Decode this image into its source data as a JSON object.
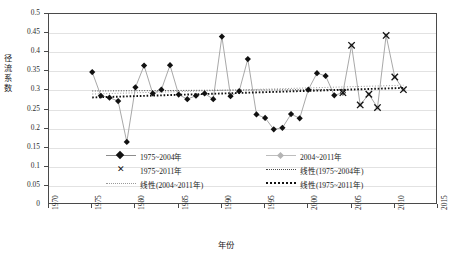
{
  "chart_data": {
    "type": "line",
    "title": "",
    "xlabel": "年份",
    "ylabel": "径流系数",
    "xlim": [
      1970,
      2015
    ],
    "ylim": [
      0,
      0.5
    ],
    "xticks": [
      "1970",
      "1975",
      "1980",
      "1985",
      "1990",
      "1995",
      "2000",
      "2005",
      "2010",
      "2015"
    ],
    "yticks": [
      "0",
      "0.05",
      "0.1",
      "0.15",
      "0.2",
      "0.25",
      "0.3",
      "0.35",
      "0.4",
      "0.45",
      "0.5"
    ],
    "grid": "horizontal",
    "legend_position": "inside-lower-center",
    "series": [
      {
        "name": "1975~2004年",
        "marker": "diamond",
        "color": "#111111",
        "line_color": "#9a9a9a",
        "x": [
          1975,
          1976,
          1977,
          1978,
          1979,
          1980,
          1981,
          1982,
          1983,
          1984,
          1985,
          1986,
          1987,
          1988,
          1989,
          1990,
          1991,
          1992,
          1993,
          1994,
          1995,
          1996,
          1997,
          1998,
          1999,
          2000,
          2001,
          2002,
          2003,
          2004
        ],
        "values": [
          0.348,
          0.286,
          0.281,
          0.272,
          0.165,
          0.308,
          0.365,
          0.292,
          0.302,
          0.366,
          0.289,
          0.277,
          0.286,
          0.292,
          0.277,
          0.441,
          0.285,
          0.298,
          0.382,
          0.237,
          0.228,
          0.198,
          0.202,
          0.238,
          0.227,
          0.302,
          0.345,
          0.338,
          0.287,
          0.294
        ]
      },
      {
        "name": "2004~2011年",
        "marker": "diamond-gray",
        "color": "#b4b4b4",
        "line_color": "#b4b4b4",
        "x": [
          2004,
          2005,
          2006,
          2007,
          2008,
          2009,
          2010,
          2011
        ],
        "values": [
          0.294,
          0.418,
          0.262,
          0.29,
          0.255,
          0.444,
          0.335,
          0.302
        ]
      },
      {
        "name": "1975~2011年",
        "marker": "x",
        "color": "#111111",
        "line_color": "#9a9a9a",
        "x": [
          2004,
          2005,
          2006,
          2007,
          2008,
          2009,
          2010,
          2011
        ],
        "values": [
          0.294,
          0.418,
          0.262,
          0.29,
          0.255,
          0.444,
          0.335,
          0.302
        ]
      }
    ],
    "trend_lines": [
      {
        "name": "线性(1975~2004年)",
        "style": "dotted-thin",
        "color": "#4a4a4a",
        "x": [
          1975,
          2004
        ],
        "values": [
          0.2985,
          0.3025
        ]
      },
      {
        "name": "线性(2004~2011年)",
        "style": "dotted-light",
        "color": "#9a9a9a",
        "x": [
          1975,
          2011
        ],
        "values": [
          0.2905,
          0.3135
        ]
      },
      {
        "name": "线性(1975~2011年)",
        "style": "dotted-bold",
        "color": "#111111",
        "x": [
          1975,
          2011
        ],
        "values": [
          0.2815,
          0.3065
        ]
      }
    ],
    "legend": [
      {
        "label": "1975~2004年",
        "key": "diamond-line"
      },
      {
        "label": "2004~2011年",
        "key": "gray-diamond-line"
      },
      {
        "label": "1975~2011年",
        "key": "x-marker"
      },
      {
        "label": "线性(1975~2004年)",
        "key": "dotted-thin"
      },
      {
        "label": "线性(2004~2011年)",
        "key": "dotted-light"
      },
      {
        "label": "线性(1975~2011年)",
        "key": "dotted-bold"
      }
    ]
  },
  "axis": {
    "y_title_chars": [
      "径",
      "流",
      "系",
      "数"
    ],
    "x_title": "年份"
  }
}
